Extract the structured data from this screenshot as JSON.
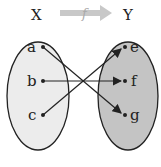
{
  "diagram": {
    "function_label": "f",
    "domain": {
      "label": "X",
      "elements": [
        "a",
        "b",
        "c"
      ],
      "fill": "#ececec"
    },
    "codomain": {
      "label": "Y",
      "elements": [
        "e",
        "f",
        "g"
      ],
      "fill": "#c4c4c4"
    },
    "mappings": [
      {
        "from": "a",
        "to": "g"
      },
      {
        "from": "b",
        "to": "f"
      },
      {
        "from": "c",
        "to": "e"
      }
    ],
    "colors": {
      "stroke": "#222222",
      "arrow_top": "#c8c8c8"
    }
  }
}
